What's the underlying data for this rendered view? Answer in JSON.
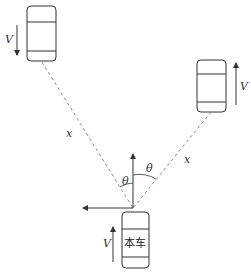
{
  "diagram": {
    "type": "vehicle-relative-motion",
    "origin_car": {
      "label": "本车",
      "velocity_label": "V",
      "direction": "up"
    },
    "left_car": {
      "velocity_label": "V",
      "direction": "down"
    },
    "right_car": {
      "velocity_label": "V",
      "direction": "up"
    },
    "distance_labels": {
      "left": "x",
      "right": "x"
    },
    "angle_labels": {
      "left": "θ",
      "right": "θ"
    },
    "colors": {
      "line": "#333333",
      "dashed": "#888888",
      "background": "#ffffff"
    }
  }
}
